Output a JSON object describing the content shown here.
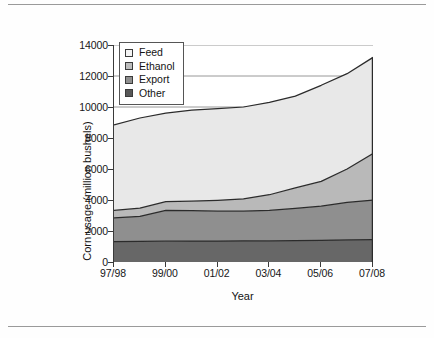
{
  "figure": {
    "top_rule": true,
    "bottom_rule": true,
    "background": "#ffffff"
  },
  "chart_data": {
    "type": "area",
    "stacked": true,
    "title": "",
    "xlabel": "Year",
    "ylabel": "Corn usage (million bushels)",
    "ylim": [
      0,
      14000
    ],
    "yticks": [
      0,
      2000,
      4000,
      6000,
      8000,
      10000,
      12000,
      14000
    ],
    "ytick_labels": [
      "0",
      "2000",
      "4000",
      "6000",
      "8000",
      "10000",
      "12000",
      "14000"
    ],
    "grid": "horizontal",
    "legend_position": "upper-left",
    "x": [
      "97/98",
      "98/99",
      "99/00",
      "00/01",
      "01/02",
      "02/03",
      "03/04",
      "04/05",
      "05/06",
      "06/07",
      "07/08"
    ],
    "xtick_labels": [
      "97/98",
      "99/00",
      "01/02",
      "03/04",
      "05/06",
      "07/08"
    ],
    "xtick_indices": [
      0,
      2,
      4,
      6,
      8,
      10
    ],
    "series": [
      {
        "name": "Other",
        "color": "#676767",
        "order": 1,
        "values": [
          1310,
          1330,
          1345,
          1350,
          1355,
          1360,
          1370,
          1385,
          1400,
          1430,
          1450
        ]
      },
      {
        "name": "Export",
        "color": "#8f8f8f",
        "order": 2,
        "values": [
          1540,
          1620,
          1990,
          1960,
          1925,
          1915,
          1960,
          2075,
          2200,
          2420,
          2550
        ]
      },
      {
        "name": "Ethanol",
        "color": "#b9b9b9",
        "order": 3,
        "values": [
          480,
          520,
          560,
          610,
          700,
          800,
          1010,
          1320,
          1600,
          2150,
          3000
        ]
      },
      {
        "name": "Feed",
        "color": "#e8e8e8",
        "order": 4,
        "values": [
          5520,
          5820,
          5705,
          5880,
          5920,
          5925,
          5960,
          5920,
          6200,
          6150,
          6200
        ]
      }
    ],
    "cumulative_totals": [
      8850,
      9290,
      9600,
      9800,
      9900,
      10000,
      10300,
      10700,
      11400,
      12150,
      13200
    ],
    "annotations": []
  },
  "legend": {
    "items": [
      {
        "label": "Feed",
        "swatch_color": "#f4f4f4"
      },
      {
        "label": "Ethanol",
        "swatch_color": "#bdbdbd"
      },
      {
        "label": "Export",
        "swatch_color": "#8f8f8f"
      },
      {
        "label": "Other",
        "swatch_color": "#585858"
      }
    ]
  }
}
